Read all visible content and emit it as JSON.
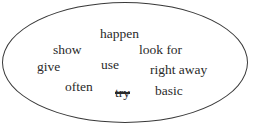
{
  "diagram": {
    "shape": "ellipse",
    "words": [
      {
        "text": "happen",
        "x": 100,
        "y": 27,
        "struck": false
      },
      {
        "text": "show",
        "x": 53,
        "y": 43,
        "struck": false
      },
      {
        "text": "look for",
        "x": 139,
        "y": 43,
        "struck": false
      },
      {
        "text": "give",
        "x": 37,
        "y": 60,
        "struck": false
      },
      {
        "text": "use",
        "x": 101,
        "y": 58,
        "struck": false
      },
      {
        "text": "right away",
        "x": 150,
        "y": 63,
        "struck": false
      },
      {
        "text": "often",
        "x": 65,
        "y": 80,
        "struck": false
      },
      {
        "text": "try",
        "x": 115,
        "y": 86,
        "struck": true
      },
      {
        "text": "basic",
        "x": 155,
        "y": 84,
        "struck": false
      }
    ]
  }
}
